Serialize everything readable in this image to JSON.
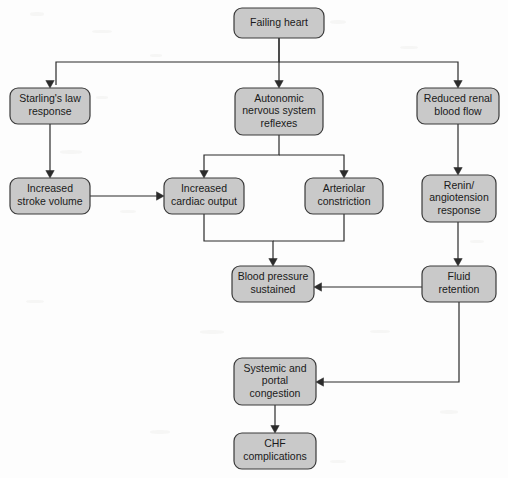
{
  "diagram": {
    "type": "flowchart",
    "canvas": {
      "width": 508,
      "height": 478
    },
    "style": {
      "background_color": "#fdfdfd",
      "node_fill": "#c9c9c9",
      "node_border": "#3a3a3a",
      "edge_color": "#2b2b2b",
      "text_color": "#1a1a1a",
      "corner_radius": 8
    },
    "nodes": [
      {
        "id": "failing-heart",
        "label": "Failing heart",
        "lines": [
          "Failing heart"
        ],
        "x": 234,
        "y": 8,
        "w": 90,
        "h": 30
      },
      {
        "id": "starlings-law-response",
        "label": "Starling's law response",
        "lines": [
          "Starling's law",
          "response"
        ],
        "x": 10,
        "y": 88,
        "w": 80,
        "h": 36
      },
      {
        "id": "autonomic-nervous-system-reflexes",
        "label": "Autonomic nervous system reflexes",
        "lines": [
          "Autonomic",
          "nervous system",
          "reflexes"
        ],
        "x": 235,
        "y": 88,
        "w": 88,
        "h": 47
      },
      {
        "id": "reduced-renal-blood-flow",
        "label": "Reduced renal blood flow",
        "lines": [
          "Reduced renal",
          "blood flow"
        ],
        "x": 417,
        "y": 88,
        "w": 82,
        "h": 36
      },
      {
        "id": "increased-stroke-volume",
        "label": "Increased stroke volume",
        "lines": [
          "Increased",
          "stroke volume"
        ],
        "x": 10,
        "y": 178,
        "w": 80,
        "h": 36
      },
      {
        "id": "increased-cardiac-output",
        "label": "Increased cardiac output",
        "lines": [
          "Increased",
          "cardiac output"
        ],
        "x": 164,
        "y": 178,
        "w": 80,
        "h": 36
      },
      {
        "id": "arteriolar-constriction",
        "label": "Arteriolar constriction",
        "lines": [
          "Arteriolar",
          "constriction"
        ],
        "x": 305,
        "y": 178,
        "w": 78,
        "h": 36
      },
      {
        "id": "renin-angiotension-response",
        "label": "Renin/ angiotension response",
        "lines": [
          "Renin/",
          "angiotension",
          "response"
        ],
        "x": 422,
        "y": 175,
        "w": 74,
        "h": 47
      },
      {
        "id": "blood-pressure-sustained",
        "label": "Blood pressure sustained",
        "lines": [
          "Blood pressure",
          "sustained"
        ],
        "x": 232,
        "y": 266,
        "w": 82,
        "h": 36
      },
      {
        "id": "fluid-retention",
        "label": "Fluid retention",
        "lines": [
          "Fluid",
          "retention"
        ],
        "x": 422,
        "y": 266,
        "w": 74,
        "h": 36
      },
      {
        "id": "systemic-and-portal-congestion",
        "label": "Systemic and portal congestion",
        "lines": [
          "Systemic and",
          "portal",
          "congestion"
        ],
        "x": 234,
        "y": 358,
        "w": 82,
        "h": 47
      },
      {
        "id": "chf-complications",
        "label": "CHF complications",
        "lines": [
          "CHF",
          "complications"
        ],
        "x": 234,
        "y": 433,
        "w": 82,
        "h": 36
      }
    ],
    "edges": [
      {
        "id": "edge-failing-heart-to-starlings-law",
        "from": "failing-heart",
        "to": "starlings-law-response",
        "path": "M 279 38 L 279 62 L 56 62 L 56 85",
        "arrow_at": [
          50,
          88
        ],
        "arrow_dir": "down"
      },
      {
        "id": "edge-failing-heart-to-autonomic-reflexes",
        "from": "failing-heart",
        "to": "autonomic-nervous-system-reflexes",
        "path": "M 279 38 L 279 85",
        "arrow_at": [
          279,
          88
        ],
        "arrow_dir": "down"
      },
      {
        "id": "edge-failing-heart-to-reduced-renal-blood-flow",
        "from": "failing-heart",
        "to": "reduced-renal-blood-flow",
        "path": "M 279 62 L 458 62 L 458 85",
        "arrow_at": [
          458,
          88
        ],
        "arrow_dir": "down"
      },
      {
        "id": "edge-starlings-law-to-increased-stroke-volume",
        "from": "starlings-law-response",
        "to": "increased-stroke-volume",
        "path": "M 50 124 L 50 175",
        "arrow_at": [
          50,
          178
        ],
        "arrow_dir": "down"
      },
      {
        "id": "edge-increased-stroke-volume-to-increased-cardiac-output",
        "from": "increased-stroke-volume",
        "to": "increased-cardiac-output",
        "path": "M 90 196 L 161 196",
        "arrow_at": [
          164,
          196
        ],
        "arrow_dir": "right"
      },
      {
        "id": "edge-autonomic-reflexes-to-increased-cardiac-output",
        "from": "autonomic-nervous-system-reflexes",
        "to": "increased-cardiac-output",
        "path": "M 279 135 L 279 155 L 204 155 L 204 175",
        "arrow_at": [
          204,
          178
        ],
        "arrow_dir": "down"
      },
      {
        "id": "edge-autonomic-reflexes-to-arteriolar-constriction",
        "from": "autonomic-nervous-system-reflexes",
        "to": "arteriolar-constriction",
        "path": "M 279 155 L 344 155 L 344 175",
        "arrow_at": [
          344,
          178
        ],
        "arrow_dir": "down"
      },
      {
        "id": "edge-reduced-renal-blood-flow-to-renin-response",
        "from": "reduced-renal-blood-flow",
        "to": "renin-angiotension-response",
        "path": "M 458 124 L 458 172",
        "arrow_at": [
          458,
          175
        ],
        "arrow_dir": "down"
      },
      {
        "id": "edge-increased-cardiac-output-to-blood-pressure",
        "from": "increased-cardiac-output",
        "to": "blood-pressure-sustained",
        "path": "M 204 214 L 204 241 L 273 241 L 273 263",
        "arrow_at": [
          273,
          266
        ],
        "arrow_dir": "down"
      },
      {
        "id": "edge-arteriolar-constriction-to-blood-pressure",
        "from": "arteriolar-constriction",
        "to": "blood-pressure-sustained",
        "path": "M 344 214 L 344 241 L 273 241",
        "arrow_at": null,
        "arrow_dir": "none"
      },
      {
        "id": "edge-renin-response-to-fluid-retention",
        "from": "renin-angiotension-response",
        "to": "fluid-retention",
        "path": "M 458 222 L 458 263",
        "arrow_at": [
          458,
          266
        ],
        "arrow_dir": "down"
      },
      {
        "id": "edge-fluid-retention-to-blood-pressure",
        "from": "fluid-retention",
        "to": "blood-pressure-sustained",
        "path": "M 422 287 L 317 287",
        "arrow_at": [
          314,
          287
        ],
        "arrow_dir": "left"
      },
      {
        "id": "edge-fluid-retention-to-systemic-portal-congestion",
        "from": "fluid-retention",
        "to": "systemic-and-portal-congestion",
        "path": "M 459 302 L 459 382 L 319 382",
        "arrow_at": [
          316,
          382
        ],
        "arrow_dir": "left"
      },
      {
        "id": "edge-systemic-congestion-to-chf-complications",
        "from": "systemic-and-portal-congestion",
        "to": "chf-complications",
        "path": "M 275 405 L 275 430",
        "arrow_at": [
          275,
          433
        ],
        "arrow_dir": "down"
      }
    ]
  }
}
